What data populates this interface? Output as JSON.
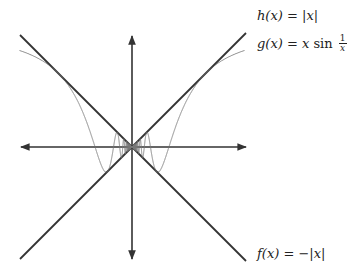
{
  "figure": {
    "colors": {
      "background": "#ffffff",
      "axes": "#333333",
      "bounds": "#333333",
      "curve": "#777777",
      "text": "#222222"
    },
    "geometry": {
      "origin_px": [
        132,
        147
      ],
      "scale_px_per_unit": 116,
      "x_axis_px": [
        20,
        246
      ],
      "y_axis_px": [
        35,
        260
      ],
      "domain": [
        -0.97,
        0.97
      ]
    }
  },
  "labels": {
    "h": {
      "lhs": "h(x)",
      "eq": " = ",
      "rhs": "|x|"
    },
    "g": {
      "lhs": "g(x)",
      "eq": " = ",
      "rhs_x": "x",
      "rhs_fn": " sin ",
      "frac_num": "1",
      "frac_den": "x"
    },
    "f": {
      "lhs": "f(x)",
      "eq": " = ",
      "rhs": "−|x|"
    }
  },
  "chart_data": {
    "type": "line",
    "title": "",
    "xlabel": "",
    "ylabel": "",
    "xlim": [
      -0.97,
      0.97
    ],
    "ylim": [
      -0.97,
      0.97
    ],
    "grid": false,
    "axes_arrows": true,
    "series": [
      {
        "name": "h(x) = |x|",
        "formula": "abs(x)",
        "style": "thick dark"
      },
      {
        "name": "g(x) = x sin(1/x)",
        "formula": "x*sin(1/x)",
        "style": "thin gray"
      },
      {
        "name": "f(x) = −|x|",
        "formula": "-abs(x)",
        "style": "thick dark"
      }
    ],
    "annotations": [
      {
        "text": "h(x) = |x|",
        "position": "upper right"
      },
      {
        "text": "g(x) = x sin 1/x",
        "position": "right, below h label"
      },
      {
        "text": "f(x) = −|x|",
        "position": "lower right"
      }
    ]
  }
}
